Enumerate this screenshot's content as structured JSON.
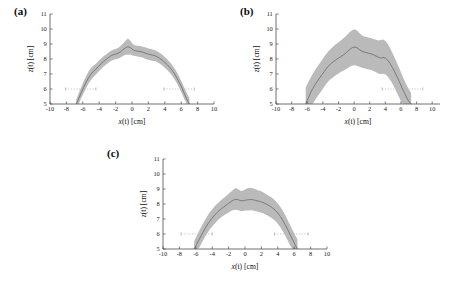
{
  "figure": {
    "panels": [
      {
        "id": "a",
        "label": "(a)"
      },
      {
        "id": "b",
        "label": "(b)"
      },
      {
        "id": "c",
        "label": "(c)"
      }
    ]
  },
  "axes": {
    "xlabel_var": "x",
    "xlabel_rest": "(t)  [cm]",
    "ylabel_var": "z",
    "ylabel_rest": "(t) [cm]",
    "xticks": [
      -10,
      -8,
      -6,
      -4,
      -2,
      0,
      2,
      4,
      6,
      8,
      10
    ],
    "yticks": [
      5,
      6,
      7,
      8,
      9,
      10,
      11
    ],
    "xlim": [
      -10,
      10
    ],
    "ylim": [
      5,
      11
    ],
    "reference_line_y": 6
  },
  "chart_data": [
    {
      "type": "area",
      "panel": "a",
      "title": "(a)",
      "xlabel": "x(t) [cm]",
      "ylabel": "z(t) [cm]",
      "xlim": [
        -10,
        10
      ],
      "ylim": [
        5,
        11
      ],
      "grid": false,
      "legend": "none",
      "reference_line_y": 6,
      "reference_segments": [
        [
          -8.1,
          -4.4
        ],
        [
          3.9,
          7.6
        ]
      ],
      "x": [
        -6.8,
        -6.5,
        -6.2,
        -5.9,
        -5.6,
        -5.3,
        -5.0,
        -4.7,
        -4.4,
        -4.1,
        -3.8,
        -3.5,
        -3.2,
        -2.9,
        -2.6,
        -2.3,
        -2.0,
        -1.7,
        -1.4,
        -1.1,
        -0.8,
        -0.5,
        -0.2,
        0.1,
        0.4,
        0.7,
        1.0,
        1.3,
        1.6,
        1.9,
        2.2,
        2.5,
        2.8,
        3.1,
        3.4,
        3.7,
        4.0,
        4.3,
        4.6,
        4.9,
        5.2,
        5.5,
        5.8,
        6.1,
        6.4,
        6.7,
        7.0
      ],
      "series": [
        {
          "name": "mean",
          "values": [
            5.0,
            5.35,
            5.75,
            6.1,
            6.45,
            6.75,
            7.0,
            7.18,
            7.32,
            7.5,
            7.68,
            7.82,
            7.95,
            8.08,
            8.2,
            8.28,
            8.32,
            8.38,
            8.48,
            8.62,
            8.75,
            8.82,
            8.76,
            8.62,
            8.55,
            8.52,
            8.5,
            8.46,
            8.4,
            8.34,
            8.3,
            8.26,
            8.22,
            8.14,
            8.04,
            7.92,
            7.78,
            7.62,
            7.44,
            7.24,
            7.0,
            6.72,
            6.4,
            6.05,
            5.68,
            5.32,
            5.0
          ]
        },
        {
          "name": "upper",
          "values": [
            5.3,
            5.72,
            6.12,
            6.5,
            6.86,
            7.16,
            7.4,
            7.56,
            7.68,
            7.86,
            8.02,
            8.16,
            8.28,
            8.42,
            8.54,
            8.62,
            8.66,
            8.74,
            8.86,
            9.04,
            9.22,
            9.36,
            9.22,
            9.0,
            8.9,
            8.88,
            8.86,
            8.82,
            8.78,
            8.72,
            8.68,
            8.64,
            8.58,
            8.5,
            8.4,
            8.28,
            8.14,
            7.98,
            7.8,
            7.6,
            7.36,
            7.08,
            6.76,
            6.42,
            6.06,
            5.7,
            5.36
          ]
        },
        {
          "name": "lower",
          "values": [
            5.0,
            5.0,
            5.38,
            5.72,
            6.06,
            6.36,
            6.6,
            6.8,
            6.96,
            7.14,
            7.32,
            7.48,
            7.62,
            7.74,
            7.86,
            7.94,
            7.98,
            8.02,
            8.1,
            8.2,
            8.28,
            8.28,
            8.3,
            8.24,
            8.2,
            8.16,
            8.14,
            8.1,
            8.02,
            7.96,
            7.92,
            7.88,
            7.86,
            7.78,
            7.68,
            7.56,
            7.42,
            7.26,
            7.08,
            6.88,
            6.64,
            6.36,
            6.04,
            5.68,
            5.3,
            5.0,
            5.0
          ]
        }
      ]
    },
    {
      "type": "area",
      "panel": "b",
      "title": "(b)",
      "xlabel": "x(t) [cm]",
      "ylabel": "z(t) [cm]",
      "xlim": [
        -10,
        11
      ],
      "ylim": [
        5,
        11
      ],
      "grid": false,
      "legend": "none",
      "reference_line_y": 6,
      "reference_segments": [
        [
          3.6,
          8.8
        ]
      ],
      "x": [
        -6.2,
        -5.9,
        -5.6,
        -5.3,
        -5.0,
        -4.7,
        -4.4,
        -4.1,
        -3.8,
        -3.5,
        -3.2,
        -2.9,
        -2.6,
        -2.3,
        -2.0,
        -1.7,
        -1.4,
        -1.1,
        -0.8,
        -0.5,
        -0.2,
        0.1,
        0.4,
        0.7,
        1.0,
        1.3,
        1.6,
        1.9,
        2.2,
        2.5,
        2.8,
        3.1,
        3.4,
        3.7,
        4.0,
        4.3,
        4.6,
        4.9,
        5.2,
        5.5,
        5.8,
        6.1,
        6.4,
        6.7,
        7.0,
        7.3
      ],
      "series": [
        {
          "name": "mean",
          "values": [
            5.0,
            5.36,
            5.72,
            6.02,
            6.28,
            6.52,
            6.74,
            6.96,
            7.18,
            7.4,
            7.58,
            7.72,
            7.84,
            7.96,
            8.06,
            8.16,
            8.26,
            8.38,
            8.52,
            8.66,
            8.76,
            8.8,
            8.74,
            8.62,
            8.52,
            8.46,
            8.42,
            8.38,
            8.34,
            8.28,
            8.2,
            8.12,
            8.06,
            8.1,
            8.06,
            7.92,
            7.7,
            7.44,
            7.14,
            6.82,
            6.48,
            6.12,
            5.78,
            5.46,
            5.18,
            5.0
          ]
        },
        {
          "name": "upper",
          "values": [
            6.1,
            6.42,
            6.72,
            7.0,
            7.26,
            7.5,
            7.72,
            7.94,
            8.16,
            8.38,
            8.56,
            8.72,
            8.86,
            9.0,
            9.12,
            9.24,
            9.36,
            9.5,
            9.66,
            9.82,
            9.94,
            9.98,
            9.88,
            9.72,
            9.58,
            9.5,
            9.46,
            9.42,
            9.38,
            9.34,
            9.28,
            9.24,
            9.26,
            9.3,
            9.22,
            9.02,
            8.74,
            8.42,
            8.08,
            7.72,
            7.36,
            6.98,
            6.62,
            6.28,
            5.98,
            5.74
          ]
        },
        {
          "name": "lower",
          "values": [
            5.0,
            5.0,
            5.0,
            5.02,
            5.26,
            5.5,
            5.72,
            5.94,
            6.16,
            6.38,
            6.56,
            6.7,
            6.82,
            6.94,
            7.04,
            7.14,
            7.22,
            7.3,
            7.4,
            7.5,
            7.56,
            7.58,
            7.54,
            7.48,
            7.42,
            7.38,
            7.34,
            7.3,
            7.26,
            7.2,
            7.12,
            7.04,
            6.98,
            7.02,
            6.98,
            6.84,
            6.62,
            6.36,
            6.06,
            5.74,
            5.4,
            5.06,
            5.0,
            5.0,
            5.0,
            5.0
          ]
        }
      ]
    },
    {
      "type": "area",
      "panel": "c",
      "title": "(c)",
      "xlabel": "x(t) [cm]",
      "ylabel": "z(t) [cm]",
      "xlim": [
        -10,
        10
      ],
      "ylim": [
        5,
        11
      ],
      "grid": false,
      "legend": "none",
      "reference_line_y": 6,
      "reference_segments": [
        [
          -7.8,
          -4.0
        ],
        [
          3.6,
          7.7
        ]
      ],
      "x": [
        -6.2,
        -5.9,
        -5.6,
        -5.3,
        -5.0,
        -4.7,
        -4.4,
        -4.1,
        -3.8,
        -3.5,
        -3.2,
        -2.9,
        -2.6,
        -2.3,
        -2.0,
        -1.7,
        -1.4,
        -1.1,
        -0.8,
        -0.5,
        -0.2,
        0.1,
        0.4,
        0.7,
        1.0,
        1.3,
        1.6,
        1.9,
        2.2,
        2.5,
        2.8,
        3.1,
        3.4,
        3.7,
        4.0,
        4.3,
        4.6,
        4.9,
        5.2,
        5.5,
        5.8,
        6.1,
        6.4
      ],
      "series": [
        {
          "name": "mean",
          "values": [
            5.0,
            5.3,
            5.62,
            5.94,
            6.24,
            6.52,
            6.78,
            7.0,
            7.2,
            7.38,
            7.54,
            7.68,
            7.8,
            7.92,
            8.04,
            8.16,
            8.26,
            8.32,
            8.28,
            8.22,
            8.22,
            8.26,
            8.28,
            8.3,
            8.28,
            8.24,
            8.2,
            8.16,
            8.1,
            8.02,
            7.94,
            7.84,
            7.72,
            7.58,
            7.4,
            7.18,
            6.92,
            6.62,
            6.3,
            5.96,
            5.62,
            5.3,
            5.0
          ]
        },
        {
          "name": "upper",
          "values": [
            5.52,
            5.86,
            6.2,
            6.52,
            6.82,
            7.1,
            7.36,
            7.58,
            7.78,
            7.96,
            8.12,
            8.26,
            8.4,
            8.54,
            8.68,
            8.82,
            8.96,
            9.06,
            8.96,
            8.86,
            8.9,
            9.0,
            9.06,
            9.08,
            9.04,
            8.98,
            8.92,
            8.86,
            8.78,
            8.68,
            8.58,
            8.48,
            8.36,
            8.22,
            8.04,
            7.82,
            7.56,
            7.26,
            6.94,
            6.6,
            6.26,
            5.94,
            5.64
          ]
        },
        {
          "name": "lower",
          "values": [
            5.0,
            5.0,
            5.06,
            5.38,
            5.68,
            5.96,
            6.22,
            6.44,
            6.64,
            6.82,
            6.98,
            7.12,
            7.24,
            7.34,
            7.44,
            7.54,
            7.6,
            7.62,
            7.58,
            7.54,
            7.54,
            7.56,
            7.56,
            7.58,
            7.56,
            7.52,
            7.48,
            7.44,
            7.38,
            7.3,
            7.22,
            7.12,
            7.0,
            6.86,
            6.68,
            6.46,
            6.2,
            5.9,
            5.58,
            5.24,
            5.0,
            5.0,
            5.0
          ]
        }
      ]
    }
  ]
}
